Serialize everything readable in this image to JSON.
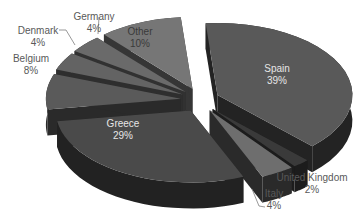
{
  "chart_data": {
    "type": "pie",
    "variant": "3d-exploded",
    "title": "",
    "legend": "none",
    "slices": [
      {
        "label": "Spain",
        "value": 39,
        "pct_label": "39%"
      },
      {
        "label": "United Kingdom",
        "value": 2,
        "pct_label": "2%"
      },
      {
        "label": "Italy",
        "value": 4,
        "pct_label": "4%"
      },
      {
        "label": "Greece",
        "value": 29,
        "pct_label": "29%"
      },
      {
        "label": "Belgium",
        "value": 8,
        "pct_label": "8%"
      },
      {
        "label": "Denmark",
        "value": 4,
        "pct_label": "4%"
      },
      {
        "label": "Germany",
        "value": 4,
        "pct_label": "4%"
      },
      {
        "label": "Other",
        "value": 10,
        "pct_label": "10%"
      }
    ]
  },
  "style": {
    "top_colors": [
      "#595959",
      "#3a3a3a",
      "#6e6e6e",
      "#4a4a4a",
      "#5a5a5a",
      "#636363",
      "#6a6a6a",
      "#767676"
    ],
    "side_colors": [
      "#232323",
      "#1c1c1c",
      "#2a2a2a",
      "#222222",
      "#2a2a2a",
      "#2e2e2e",
      "#313131",
      "#363636"
    ],
    "inside_label_color": "#e6e6e6",
    "outside_label_color": "#595959"
  },
  "labels": {
    "spain": {
      "name": "Spain",
      "pct": "39%"
    },
    "uk": {
      "name": "United Kingdom",
      "pct": "2%"
    },
    "italy": {
      "name": "Italy",
      "pct": "4%"
    },
    "greece": {
      "name": "Greece",
      "pct": "29%"
    },
    "belgium": {
      "name": "Belgium",
      "pct": "8%"
    },
    "denmark": {
      "name": "Denmark",
      "pct": "4%"
    },
    "germany": {
      "name": "Germany",
      "pct": "4%"
    },
    "other": {
      "name": "Other",
      "pct": "10%"
    }
  }
}
